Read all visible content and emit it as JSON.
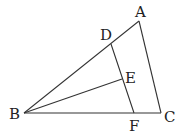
{
  "diagram": {
    "type": "geometry",
    "points": {
      "A": {
        "label": "A",
        "x": 139,
        "y": 21,
        "lx": 135,
        "ly": 17
      },
      "B": {
        "label": "B",
        "x": 24,
        "y": 113,
        "lx": 11,
        "ly": 119
      },
      "C": {
        "label": "C",
        "x": 161,
        "y": 113,
        "lx": 164,
        "ly": 122
      },
      "D": {
        "label": "D",
        "x": 111,
        "y": 44,
        "lx": 100,
        "ly": 40
      },
      "E": {
        "label": "E",
        "x": 122,
        "y": 79,
        "lx": 125,
        "ly": 83
      },
      "F": {
        "label": "F",
        "x": 134,
        "y": 113,
        "lx": 129,
        "ly": 130
      }
    },
    "segments": [
      "AB",
      "AC",
      "BC",
      "DF",
      "BE"
    ]
  }
}
